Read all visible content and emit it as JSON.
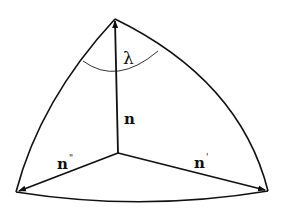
{
  "diagram": {
    "type": "spherical-triangle",
    "labels": {
      "angle": "λ",
      "vector_up": "n",
      "vector_left": "n",
      "vector_left_prime": "\"",
      "vector_right": "n",
      "vector_right_prime": "'"
    },
    "colors": {
      "stroke": "#111111",
      "background": "#ffffff"
    }
  }
}
